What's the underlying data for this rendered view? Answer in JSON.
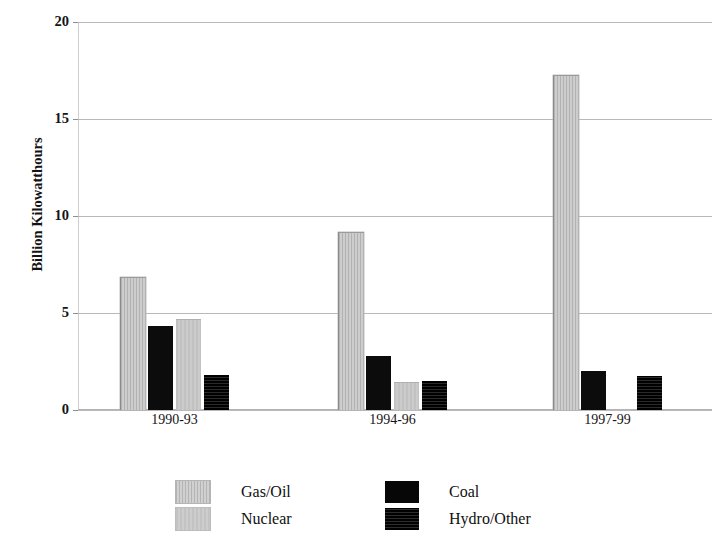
{
  "chart_data": {
    "type": "bar",
    "title": "",
    "xlabel": "",
    "ylabel": "Billion Kilowatthours",
    "ylim": [
      0,
      20
    ],
    "yticks": [
      0,
      5,
      10,
      15,
      20
    ],
    "ytick_labels": [
      "0",
      "5",
      "10",
      "15",
      "20"
    ],
    "grid": true,
    "legend_position": "bottom",
    "categories": [
      "1990-93",
      "1994-96",
      "1997-99"
    ],
    "series": [
      {
        "name": "Gas/Oil",
        "color": "#c8c8c8",
        "values": [
          6.8,
          9.15,
          17.2
        ]
      },
      {
        "name": "Coal",
        "color": "#0c0c0c",
        "values": [
          4.35,
          2.8,
          2.0
        ]
      },
      {
        "name": "Nuclear",
        "color": "#c6c6c6",
        "values": [
          4.65,
          1.4,
          null
        ]
      },
      {
        "name": "Hydro/Other",
        "color": "#141414",
        "values": [
          1.8,
          1.5,
          1.75
        ]
      }
    ]
  },
  "legend": {
    "entries": [
      {
        "label": "Gas/Oil",
        "swatch": "gasoil"
      },
      {
        "label": "Coal",
        "swatch": "coal"
      },
      {
        "label": "Nuclear",
        "swatch": "nuclear"
      },
      {
        "label": "Hydro/Other",
        "swatch": "hydro"
      }
    ]
  }
}
